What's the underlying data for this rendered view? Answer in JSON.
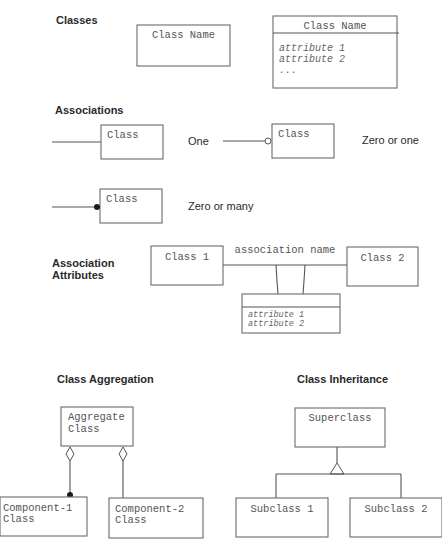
{
  "sections": {
    "classes": {
      "title": "Classes",
      "simple_class": {
        "name": "Class Name"
      },
      "detailed_class": {
        "name": "Class Name",
        "attributes": [
          "attribute 1",
          "attribute 2",
          "..."
        ]
      }
    },
    "associations": {
      "title": "Associations",
      "items": [
        {
          "class_label": "Class",
          "multiplicity": "One",
          "end_marker": "none"
        },
        {
          "class_label": "Class",
          "multiplicity": "Zero or one",
          "end_marker": "hollow-circle"
        },
        {
          "class_label": "Class",
          "multiplicity": "Zero or many",
          "end_marker": "filled-circle"
        }
      ]
    },
    "association_attributes": {
      "title_line1": "Association",
      "title_line2": "Attributes",
      "class1": "Class 1",
      "class2": "Class 2",
      "association_name": "association name",
      "link_attributes": [
        "attribute 1",
        "attribute 2"
      ]
    },
    "aggregation": {
      "title": "Class Aggregation",
      "aggregate": {
        "line1": "Aggregate",
        "line2": "Class"
      },
      "component1": {
        "line1": "Component-1",
        "line2": "Class"
      },
      "component2": {
        "line1": "Component-2",
        "line2": "Class"
      }
    },
    "inheritance": {
      "title": "Class Inheritance",
      "superclass": "Superclass",
      "subclass1": "Subclass 1",
      "subclass2": "Subclass 2"
    }
  },
  "colors": {
    "stroke": "#6b6b6b",
    "class_text": "#555555",
    "label_text": "#2a2a2a",
    "background": "#ffffff"
  }
}
